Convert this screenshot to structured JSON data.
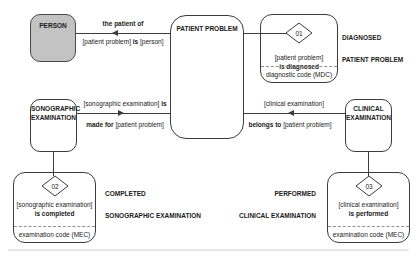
{
  "diagram": {
    "colors": {
      "person_fill": "#c3c3c3",
      "line": "#3c3c3c",
      "background": "#ffffff"
    },
    "entities": {
      "person": {
        "label": "PERSON"
      },
      "patient_problem": {
        "label": "PATIENT PROBLEM"
      },
      "sonographic_examination": {
        "line1": "SONOGRAPHIC",
        "line2": "EXAMINATION"
      },
      "clinical_examination": {
        "line1": "CLINICAL",
        "line2": "EXAMINATION"
      }
    },
    "relations": {
      "patient_of": {
        "above": "the patient of",
        "below_obj1": "[patient problem]",
        "below_verb": "is",
        "below_obj2": "[person]"
      },
      "made_for": {
        "above_obj": "[sonographic examination]",
        "above_verb": "is",
        "below_verb": "made for",
        "below_obj": "[patient problem]"
      },
      "belongs_to": {
        "above_obj": "[clinical examination]",
        "below_verb": "belongs to",
        "below_obj": "[patient problem]"
      }
    },
    "annotations": {
      "diagnosed": {
        "code": "01",
        "obj": "[patient problem]",
        "verb": "is diagnosed",
        "footer": "diagnostic code (MDC)",
        "title_line1": "DIAGNOSED",
        "title_line2": "PATIENT PROBLEM"
      },
      "completed": {
        "code": "02",
        "obj": "[sonographic examination]",
        "verb": "is completed",
        "footer": "examination code (MEC)",
        "title_line1": "COMPLETED",
        "title_line2": "SONOGRAPHIC EXAMINATION"
      },
      "performed": {
        "code": "03",
        "obj": "[clinical examination]",
        "verb": "is performed",
        "footer": "examination code (MEC)",
        "title_line1": "PERFORMED",
        "title_line2": "CLINICAL EXAMINATION"
      }
    }
  }
}
